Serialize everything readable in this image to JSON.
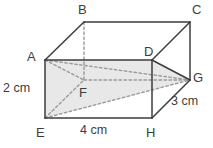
{
  "figure": {
    "shape": "cuboid",
    "stroke_color": "#3d3d3d",
    "dashed_color": "#9a9a9a",
    "shade_fill": "#e8e8e8",
    "background": "#ffffff"
  },
  "vertices": [
    {
      "id": "A",
      "label": "A",
      "x": 45,
      "y": 60,
      "label_x": 27,
      "label_y": 50,
      "hidden": false
    },
    {
      "id": "B",
      "label": "B",
      "x": 84,
      "y": 22,
      "label_x": 78,
      "label_y": 3,
      "hidden": false
    },
    {
      "id": "C",
      "label": "C",
      "x": 190,
      "y": 22,
      "label_x": 192,
      "label_y": 3,
      "hidden": false
    },
    {
      "id": "D",
      "label": "D",
      "x": 152,
      "y": 60,
      "label_x": 144,
      "label_y": 45,
      "hidden": false
    },
    {
      "id": "E",
      "label": "E",
      "x": 45,
      "y": 118,
      "label_x": 36,
      "label_y": 126,
      "hidden": false
    },
    {
      "id": "F",
      "label": "F",
      "x": 84,
      "y": 80,
      "label_x": 79,
      "label_y": 86,
      "hidden": true
    },
    {
      "id": "G",
      "label": "G",
      "x": 190,
      "y": 80,
      "label_x": 193,
      "label_y": 71,
      "hidden": false
    },
    {
      "id": "H",
      "label": "H",
      "x": 152,
      "y": 118,
      "label_x": 146,
      "label_y": 126,
      "hidden": false
    }
  ],
  "edges_solid": [
    {
      "from": "A",
      "to": "B"
    },
    {
      "from": "B",
      "to": "C"
    },
    {
      "from": "C",
      "to": "D"
    },
    {
      "from": "C",
      "to": "G"
    },
    {
      "from": "A",
      "to": "D"
    },
    {
      "from": "D",
      "to": "G"
    },
    {
      "from": "A",
      "to": "E"
    },
    {
      "from": "D",
      "to": "H"
    },
    {
      "from": "E",
      "to": "H"
    },
    {
      "from": "H",
      "to": "G"
    }
  ],
  "edges_dashed": [
    {
      "from": "B",
      "to": "F"
    },
    {
      "from": "F",
      "to": "G"
    },
    {
      "from": "E",
      "to": "F"
    },
    {
      "from": "A",
      "to": "F"
    },
    {
      "from": "E",
      "to": "G"
    },
    {
      "from": "A",
      "to": "G"
    }
  ],
  "shaded_plane": {
    "name": "plane-ADGE",
    "points": [
      "A",
      "D",
      "G",
      "E"
    ]
  },
  "measurements": [
    {
      "id": "height",
      "value": "2 cm",
      "edge": "A-E",
      "x": 3,
      "y": 82
    },
    {
      "id": "width",
      "value": "4 cm",
      "edge": "E-H",
      "x": 80,
      "y": 124
    },
    {
      "id": "depth",
      "value": "3 cm",
      "edge": "H-G",
      "x": 171,
      "y": 95
    }
  ]
}
